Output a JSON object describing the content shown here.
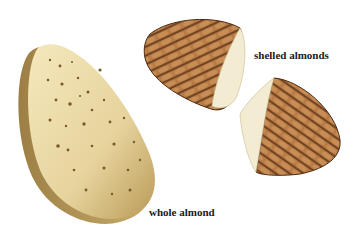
{
  "labels": {
    "shelled": "shelled almonds",
    "whole": "whole almond"
  },
  "colors": {
    "shell_light": "#efe2b4",
    "shell_mid": "#d9c48a",
    "shell_dark": "#a88a4c",
    "skin_brown": "#a86a3a",
    "skin_dark": "#5a3216",
    "kernel_cream": "#f3ecd2",
    "text": "#1a1a1a"
  }
}
